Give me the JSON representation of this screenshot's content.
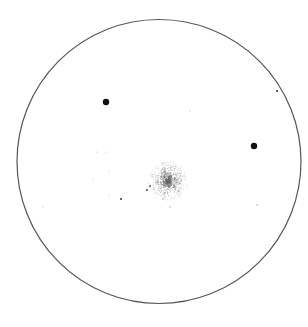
{
  "image": {
    "subject": "Eyepiece sketch of a globular star cluster",
    "width": 308,
    "height": 327,
    "background": "#ffffff"
  },
  "field": {
    "cx": 159,
    "cy": 161.5,
    "r": 142,
    "stroke": "#555555"
  },
  "cluster": {
    "cx": 168,
    "cy": 181,
    "core_r": 7,
    "halo_r": 20,
    "color": "#6a6a6a"
  },
  "stars": [
    {
      "x": 106,
      "y": 102,
      "r": 3.2,
      "color": "#111111"
    },
    {
      "x": 254,
      "y": 146,
      "r": 3.2,
      "color": "#111111"
    },
    {
      "x": 277,
      "y": 91,
      "r": 1.1,
      "color": "#333333"
    },
    {
      "x": 121,
      "y": 199,
      "r": 1.0,
      "color": "#333333"
    },
    {
      "x": 147,
      "y": 190,
      "r": 1.0,
      "color": "#444444"
    },
    {
      "x": 150,
      "y": 186,
      "r": 0.9,
      "color": "#555555"
    },
    {
      "x": 170,
      "y": 207,
      "r": 0.6,
      "color": "#888888"
    },
    {
      "x": 190,
      "y": 111,
      "r": 0.6,
      "color": "#aaaaaa"
    },
    {
      "x": 97,
      "y": 152,
      "r": 0.6,
      "color": "#bbbbbb"
    },
    {
      "x": 106,
      "y": 152,
      "r": 0.6,
      "color": "#bbbbbb"
    },
    {
      "x": 109,
      "y": 171,
      "r": 0.6,
      "color": "#bbbbbb"
    },
    {
      "x": 93,
      "y": 179,
      "r": 0.6,
      "color": "#bbbbbb"
    },
    {
      "x": 109,
      "y": 195,
      "r": 0.6,
      "color": "#bbbbbb"
    },
    {
      "x": 257,
      "y": 205,
      "r": 0.7,
      "color": "#999999"
    },
    {
      "x": 43,
      "y": 207,
      "r": 0.6,
      "color": "#bbbbbb"
    }
  ]
}
